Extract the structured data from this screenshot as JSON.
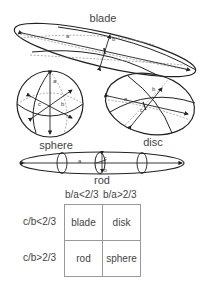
{
  "figure": {
    "shapes": [
      {
        "id": "blade",
        "label": "blade",
        "axes": [
          "a",
          "b",
          "c"
        ]
      },
      {
        "id": "sphere",
        "label": "sphere",
        "axes": [
          "a",
          "b",
          "c"
        ]
      },
      {
        "id": "disc",
        "label": "disc",
        "axes": [
          "a",
          "b",
          "c"
        ]
      },
      {
        "id": "rod",
        "label": "rod",
        "axes": [
          "a",
          "b",
          "c"
        ]
      }
    ],
    "axis_labels": {
      "a": "a",
      "b": "b",
      "c": "c"
    }
  },
  "classification_table": {
    "column_headers": [
      "b/a<2/3",
      "b/a>2/3"
    ],
    "rows": [
      {
        "header": "c/b<2/3",
        "cells": [
          "blade",
          "disk"
        ]
      },
      {
        "header": "c/b>2/3",
        "cells": [
          "rod",
          "sphere"
        ]
      }
    ]
  },
  "colors": {
    "line": "#222222",
    "dashed": "#888888",
    "text": "#444444",
    "table_border": "#999999"
  }
}
